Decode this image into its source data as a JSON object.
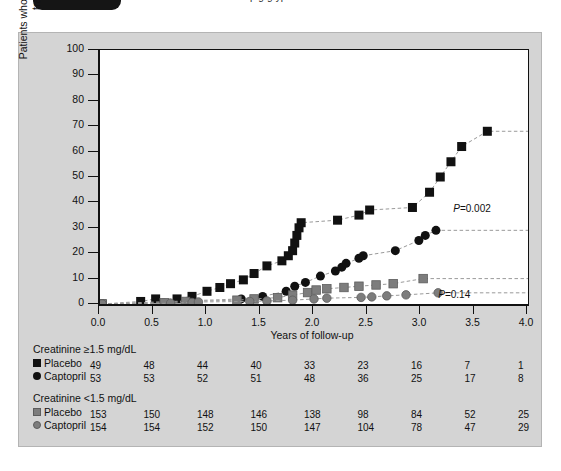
{
  "top_strip": {
    "clipped_caption": "pig    g   yp",
    "tag_label": ""
  },
  "figure": {
    "background_color": "#d4d4d4",
    "plot_background": "#ffffff"
  },
  "chart_data": {
    "type": "line",
    "title": "",
    "xlabel": "Years of follow-up",
    "ylabel": "Patients who died or needed dialysis or transplantation, %",
    "xlim": [
      0.0,
      4.0
    ],
    "ylim": [
      0,
      100
    ],
    "xticks": [
      "0.0",
      "0.5",
      "1.0",
      "1.5",
      "2.0",
      "2.5",
      "3.0",
      "3.5",
      "4.0"
    ],
    "yticks": [
      "0",
      "10",
      "20",
      "30",
      "40",
      "50",
      "60",
      "70",
      "80",
      "90",
      "100"
    ],
    "grid": false,
    "legend_position": "below-axes-risk-table",
    "annotations": [
      {
        "text": "P=0.002",
        "x": 3.32,
        "y": 37.0
      },
      {
        "text": "P=0.14",
        "x": 3.18,
        "y": 3.0
      }
    ],
    "series": [
      {
        "name": "Placebo, creatinine ≥1.5 mg/dL",
        "marker": "square",
        "color": "#111111",
        "points": [
          [
            0.02,
            0.0
          ],
          [
            0.38,
            1.0
          ],
          [
            0.52,
            2.0
          ],
          [
            0.72,
            2.0
          ],
          [
            0.86,
            3.0
          ],
          [
            1.0,
            5.0
          ],
          [
            1.12,
            6.5
          ],
          [
            1.22,
            8.0
          ],
          [
            1.34,
            9.5
          ],
          [
            1.44,
            12.0
          ],
          [
            1.56,
            15.0
          ],
          [
            1.7,
            17.0
          ],
          [
            1.76,
            19.0
          ],
          [
            1.8,
            21.0
          ],
          [
            1.82,
            24.0
          ],
          [
            1.84,
            27.0
          ],
          [
            1.86,
            30.0
          ],
          [
            1.88,
            32.0
          ],
          [
            2.22,
            33.0
          ],
          [
            2.42,
            35.0
          ],
          [
            2.52,
            37.0
          ],
          [
            2.92,
            38.0
          ],
          [
            3.08,
            44.0
          ],
          [
            3.18,
            50.0
          ],
          [
            3.28,
            56.0
          ],
          [
            3.38,
            62.0
          ],
          [
            3.62,
            68.0
          ]
        ],
        "tail_to": 4.0
      },
      {
        "name": "Captopril, creatinine ≥1.5 mg/dL",
        "marker": "circle",
        "color": "#111111",
        "points": [
          [
            0.02,
            0.0
          ],
          [
            1.32,
            2.0
          ],
          [
            1.52,
            3.0
          ],
          [
            1.74,
            5.0
          ],
          [
            1.82,
            7.0
          ],
          [
            1.92,
            8.5
          ],
          [
            2.06,
            11.0
          ],
          [
            2.2,
            13.0
          ],
          [
            2.26,
            14.5
          ],
          [
            2.3,
            16.0
          ],
          [
            2.42,
            18.0
          ],
          [
            2.46,
            19.0
          ],
          [
            2.76,
            21.0
          ],
          [
            2.98,
            25.0
          ],
          [
            3.04,
            27.0
          ],
          [
            3.14,
            29.0
          ]
        ],
        "tail_to": 4.0
      },
      {
        "name": "Placebo, creatinine <1.5 mg/dL",
        "marker": "square",
        "color": "#7d7d7d",
        "points": [
          [
            0.02,
            0.0
          ],
          [
            0.6,
            0.5
          ],
          [
            0.8,
            1.0
          ],
          [
            1.28,
            1.5
          ],
          [
            1.44,
            2.0
          ],
          [
            1.66,
            2.5
          ],
          [
            1.8,
            3.5
          ],
          [
            1.94,
            4.5
          ],
          [
            2.02,
            5.5
          ],
          [
            2.12,
            6.0
          ],
          [
            2.28,
            6.5
          ],
          [
            2.42,
            7.0
          ],
          [
            2.58,
            7.5
          ],
          [
            2.74,
            8.0
          ],
          [
            3.02,
            10.0
          ]
        ],
        "tail_to": 4.0
      },
      {
        "name": "Captopril, creatinine <1.5 mg/dL",
        "marker": "circle",
        "color": "#7d7d7d",
        "points": [
          [
            0.02,
            0.0
          ],
          [
            0.66,
            0.3
          ],
          [
            0.86,
            0.6
          ],
          [
            0.92,
            0.8
          ],
          [
            1.4,
            1.0
          ],
          [
            1.56,
            1.2
          ],
          [
            1.8,
            1.5
          ],
          [
            2.0,
            2.0
          ],
          [
            2.12,
            2.3
          ],
          [
            2.44,
            2.6
          ],
          [
            2.54,
            2.8
          ],
          [
            2.68,
            3.2
          ],
          [
            2.86,
            3.6
          ],
          [
            3.16,
            4.4
          ]
        ],
        "tail_to": 4.0
      }
    ]
  },
  "risk_table": {
    "groups": [
      {
        "title": "Creatinine ≥1.5 mg/dL",
        "rows": [
          {
            "marker": "square-black",
            "label": "Placebo",
            "values": [
              "49",
              "48",
              "44",
              "40",
              "33",
              "23",
              "16",
              "7",
              "1"
            ]
          },
          {
            "marker": "circle-black",
            "label": "Captopril",
            "values": [
              "53",
              "53",
              "52",
              "51",
              "48",
              "36",
              "25",
              "17",
              "8"
            ]
          }
        ]
      },
      {
        "title": "Creatinine <1.5 mg/dL",
        "rows": [
          {
            "marker": "square-gray",
            "label": "Placebo",
            "values": [
              "153",
              "150",
              "148",
              "146",
              "138",
              "98",
              "84",
              "52",
              "25"
            ]
          },
          {
            "marker": "circle-gray",
            "label": "Captopril",
            "values": [
              "154",
              "154",
              "152",
              "150",
              "147",
              "104",
              "78",
              "47",
              "29"
            ]
          }
        ]
      }
    ]
  },
  "colors": {
    "panel": "#d4d4d4",
    "plot": "#ffffff",
    "series_dark": "#111111",
    "series_gray": "#7d7d7d",
    "axis": "#111111",
    "dashed": "#9a9a9a"
  }
}
